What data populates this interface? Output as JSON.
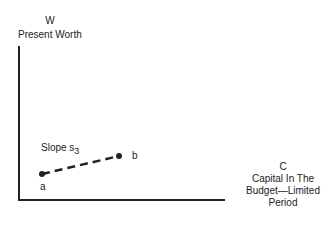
{
  "y_axis": {
    "symbol": "W",
    "label": "Present Worth"
  },
  "x_axis": {
    "symbol": "C",
    "label_lines": [
      "Capital In The",
      "Budget—Limited",
      "Period"
    ]
  },
  "segment": {
    "slope_label": "Slope s",
    "slope_subscript": "3",
    "start_point": "a",
    "end_point": "b",
    "style": "dashed"
  }
}
